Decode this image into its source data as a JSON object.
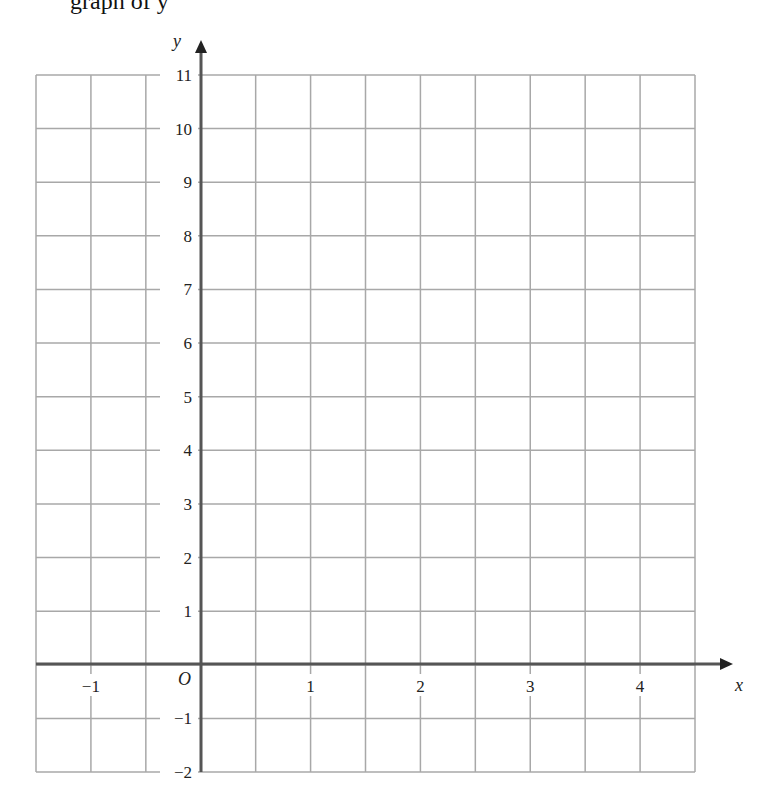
{
  "header": {
    "clipped_text": "graph of y"
  },
  "chart_data": {
    "type": "line",
    "title": "",
    "xlabel": "x",
    "ylabel": "y",
    "origin_label": "O",
    "xlim": [
      -1.5,
      4.5
    ],
    "ylim": [
      -2,
      11
    ],
    "x_ticks": [
      -1,
      1,
      2,
      3,
      4
    ],
    "x_tick_labels": [
      "−1",
      "1",
      "2",
      "3",
      "4"
    ],
    "y_ticks": [
      11,
      10,
      9,
      8,
      7,
      6,
      5,
      4,
      3,
      2,
      1,
      -1,
      -2
    ],
    "y_tick_labels": [
      "11",
      "10",
      "9",
      "8",
      "7",
      "6",
      "5",
      "4",
      "3",
      "2",
      "1",
      "−1",
      "−2"
    ],
    "grid": true,
    "grid_x_step": 0.5,
    "grid_y_step": 1,
    "series": [],
    "colors": {
      "grid": "#a8a8a8",
      "axis": "#555555",
      "text": "#222222"
    }
  }
}
